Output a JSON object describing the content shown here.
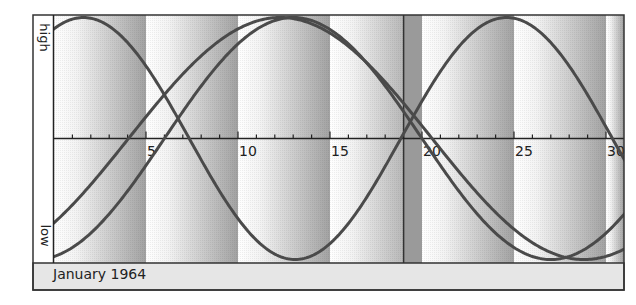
{
  "chart_data": {
    "type": "line",
    "footer_label": "January 1964",
    "ylabel_high": "high",
    "ylabel_low": "low",
    "xlabel": "",
    "ylabel": "",
    "xlim": [
      0,
      31
    ],
    "ylim": [
      -1,
      1
    ],
    "x_tick_labels": [
      "5",
      "10",
      "15",
      "20",
      "25",
      "30"
    ],
    "x_tick_values": [
      5,
      10,
      15,
      20,
      25,
      30
    ],
    "minor_tick_step": 1,
    "marker_day": 19,
    "series": [
      {
        "name": "Physical",
        "period_days": 23,
        "peak_day": 1.6
      },
      {
        "name": "Intellectual",
        "period_days": 33,
        "peak_day": 12.3
      },
      {
        "name": "Emotional",
        "period_days": 28,
        "peak_day": 13.0
      }
    ],
    "band_width_days": 5,
    "grid": false
  },
  "colors": {
    "curve": "#4a4a4a",
    "frame": "#333333",
    "band_light": "#ffffff",
    "band_dark": "#a2a2a2",
    "marker_band": "#9a9a9a",
    "footer_bg": "#e6e6e6"
  }
}
